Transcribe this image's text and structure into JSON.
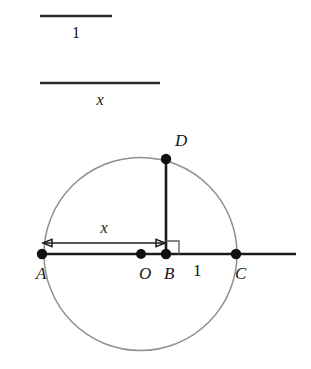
{
  "figure": {
    "width": 311,
    "height": 369,
    "background": "#ffffff",
    "colors": {
      "circle_stroke": "#8f8f8f",
      "line_stroke": "#1c1c1c",
      "point_fill": "#111111",
      "right_angle_stroke": "#5d5d5d",
      "label_color": "#161616"
    }
  },
  "reference_segments": [
    {
      "name": "unit-segment",
      "label": "1",
      "italic": false,
      "x1": 40,
      "x2": 112,
      "y": 16,
      "label_x": 76,
      "label_y": 38
    },
    {
      "name": "x-segment",
      "label": "x",
      "italic": true,
      "x1": 40,
      "x2": 160,
      "y": 83,
      "label_x": 100,
      "label_y": 105
    }
  ],
  "circle": {
    "name": "main-circle",
    "center_x": 140.5,
    "center_y": 254,
    "radius": 96.5
  },
  "baseline": {
    "name": "horizontal-line-AC",
    "x1": 41,
    "x2": 296,
    "y": 254
  },
  "chord": {
    "name": "segment-BD",
    "x": 166,
    "y1": 159,
    "y2": 254
  },
  "right_angle_marker": {
    "name": "right-angle-at-B",
    "x": 166,
    "y": 254,
    "size": 13
  },
  "dimension": {
    "name": "dimension-x-AB",
    "label": "x",
    "italic": true,
    "x1": 43,
    "x2": 165,
    "y": 243,
    "label_x": 104,
    "label_y": 233
  },
  "points": [
    {
      "name": "point-A",
      "label": "A",
      "italic": true,
      "x": 42,
      "y": 254,
      "r": 5.2,
      "label_x": 36,
      "label_y": 279
    },
    {
      "name": "point-O",
      "label": "O",
      "italic": true,
      "x": 141,
      "y": 254,
      "r": 5.0,
      "label_x": 139,
      "label_y": 279
    },
    {
      "name": "point-B",
      "label": "B",
      "italic": true,
      "x": 166,
      "y": 254,
      "r": 5.2,
      "label_x": 164,
      "label_y": 279
    },
    {
      "name": "point-C",
      "label": "C",
      "italic": true,
      "x": 236,
      "y": 254,
      "r": 5.2,
      "label_x": 235,
      "label_y": 279
    },
    {
      "name": "point-D",
      "label": "D",
      "italic": true,
      "x": 166,
      "y": 159,
      "r": 5.2,
      "label_x": 175,
      "label_y": 146
    }
  ],
  "annotations": [
    {
      "name": "unit-label-BC",
      "label": "1",
      "italic": false,
      "x": 193,
      "y": 276
    }
  ]
}
